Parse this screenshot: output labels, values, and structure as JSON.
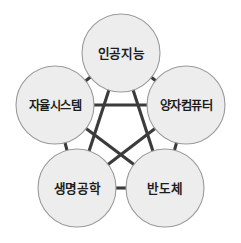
{
  "diagram": {
    "title": "",
    "background_color": "#ffffff",
    "node_fill_color": "#ededed",
    "node_stroke_color": "#9a9a9a",
    "edge_color": "#3b3b3b",
    "label_color": "#1d1d1d",
    "node_radius": 39,
    "nodes": [
      {
        "id": "ai",
        "label": "인공지능",
        "cx": 121,
        "cy": 53,
        "r": 39
      },
      {
        "id": "quantum",
        "label": "양자컴퓨터",
        "cx": 186,
        "cy": 105,
        "r": 39
      },
      {
        "id": "semicon",
        "label": "반도체",
        "cx": 165,
        "cy": 188,
        "r": 39
      },
      {
        "id": "bio",
        "label": "생명공학",
        "cx": 77,
        "cy": 188,
        "r": 39
      },
      {
        "id": "autonomous",
        "label": "자율시스템",
        "cx": 55,
        "cy": 105,
        "r": 39
      }
    ],
    "edges": [
      {
        "from": "ai",
        "to": "quantum"
      },
      {
        "from": "quantum",
        "to": "semicon"
      },
      {
        "from": "semicon",
        "to": "bio"
      },
      {
        "from": "bio",
        "to": "autonomous"
      },
      {
        "from": "autonomous",
        "to": "ai"
      },
      {
        "from": "ai",
        "to": "semicon"
      },
      {
        "from": "ai",
        "to": "bio"
      },
      {
        "from": "quantum",
        "to": "bio"
      },
      {
        "from": "quantum",
        "to": "autonomous"
      },
      {
        "from": "semicon",
        "to": "autonomous"
      }
    ]
  }
}
